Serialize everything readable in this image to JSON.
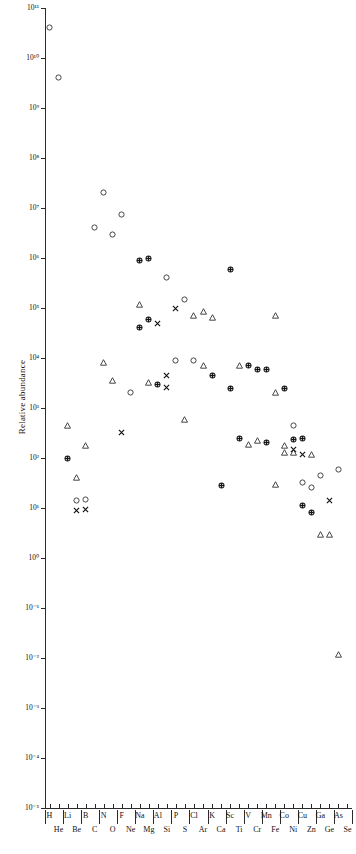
{
  "figure": {
    "ylabel": "Relative abundance",
    "plot": {
      "left": 45,
      "right": 352,
      "top": 8,
      "bottom": 808
    }
  },
  "chart_data": {
    "type": "scatter",
    "title": "",
    "xlabel": "",
    "ylabel": "Relative abundance",
    "xscale": "categorical",
    "yscale": "log",
    "ylim": [
      1e-05,
      100000000000.0
    ],
    "grid": false,
    "legend": "none",
    "ytick_labels": [
      "10¹¹",
      "10¹⁰",
      "10⁹",
      "10⁸",
      "10⁷",
      "10⁶",
      "10⁵",
      "10⁴",
      "10³",
      "10²",
      "10¹",
      "10⁰",
      "10⁻¹",
      "10⁻²",
      "10⁻³",
      "10⁻⁴",
      "10⁻⁵"
    ],
    "ytick_values": [
      100000000000.0,
      10000000000.0,
      1000000000.0,
      100000000.0,
      10000000.0,
      1000000.0,
      100000.0,
      10000.0,
      1000.0,
      100.0,
      10,
      1,
      0.1,
      0.01,
      0.001,
      0.0001,
      1e-05
    ],
    "categories": [
      "H",
      "He",
      "Li",
      "Be",
      "B",
      "C",
      "N",
      "O",
      "F",
      "Ne",
      "Na",
      "Mg",
      "Al",
      "Si",
      "P",
      "S",
      "Cl",
      "Ar",
      "K",
      "Ca",
      "Sc",
      "Ti",
      "V",
      "Cr",
      "Mn",
      "Fe",
      "Co",
      "Ni",
      "Cu",
      "Zn",
      "Ga",
      "Ge",
      "As",
      "Se"
    ],
    "categories_top_row": [
      "H",
      "Li",
      "B",
      "N",
      "F",
      "Na",
      "Al",
      "P",
      "Cl",
      "K",
      "Sc",
      "V",
      "Mn",
      "Co",
      "Cu",
      "Ga",
      "As"
    ],
    "categories_bottom_row": [
      "He",
      "Be",
      "C",
      "O",
      "Ne",
      "Mg",
      "Si",
      "S",
      "Ar",
      "Ca",
      "Ti",
      "Cr",
      "Fe",
      "Ni",
      "Zn",
      "Ge",
      "Se"
    ],
    "marker_kinds": [
      "open-circle",
      "open-triangle",
      "cross-x",
      "dotted-filled-circle"
    ],
    "points": [
      {
        "element": "H",
        "xi": 0,
        "y": 40000000000.0,
        "marker": "open-circle"
      },
      {
        "element": "He",
        "xi": 1,
        "y": 4000000000.0,
        "marker": "open-circle"
      },
      {
        "element": "Li",
        "xi": 2,
        "y": 450.0,
        "marker": "open-triangle"
      },
      {
        "element": "Li",
        "xi": 2,
        "y": 100.0,
        "marker": "dotted-filled-circle"
      },
      {
        "element": "Be",
        "xi": 3,
        "y": 40.0,
        "marker": "open-triangle"
      },
      {
        "element": "Be",
        "xi": 3,
        "y": 14.0,
        "marker": "open-circle"
      },
      {
        "element": "Be",
        "xi": 3,
        "y": 9.0,
        "marker": "cross-x"
      },
      {
        "element": "B",
        "xi": 4,
        "y": 180.0,
        "marker": "open-triangle"
      },
      {
        "element": "B",
        "xi": 4,
        "y": 15.0,
        "marker": "open-circle"
      },
      {
        "element": "B",
        "xi": 4,
        "y": 9.5,
        "marker": "cross-x"
      },
      {
        "element": "C",
        "xi": 5,
        "y": 4000000.0,
        "marker": "open-circle"
      },
      {
        "element": "N",
        "xi": 6,
        "y": 20000000.0,
        "marker": "open-circle"
      },
      {
        "element": "N",
        "xi": 6,
        "y": 8000.0,
        "marker": "open-triangle"
      },
      {
        "element": "O",
        "xi": 7,
        "y": 3000000.0,
        "marker": "open-circle"
      },
      {
        "element": "O",
        "xi": 7,
        "y": 3500.0,
        "marker": "open-triangle"
      },
      {
        "element": "F",
        "xi": 8,
        "y": 7500000.0,
        "marker": "open-circle"
      },
      {
        "element": "F",
        "xi": 8,
        "y": 320.0,
        "marker": "cross-x"
      },
      {
        "element": "Ne",
        "xi": 9,
        "y": 2000.0,
        "marker": "open-circle"
      },
      {
        "element": "Na",
        "xi": 10,
        "y": 900000.0,
        "marker": "dotted-filled-circle"
      },
      {
        "element": "Na",
        "xi": 10,
        "y": 120000.0,
        "marker": "open-triangle"
      },
      {
        "element": "Na",
        "xi": 10,
        "y": 40000.0,
        "marker": "dotted-filled-circle"
      },
      {
        "element": "Mg",
        "xi": 11,
        "y": 1000000.0,
        "marker": "dotted-filled-circle"
      },
      {
        "element": "Mg",
        "xi": 11,
        "y": 60000.0,
        "marker": "dotted-filled-circle"
      },
      {
        "element": "Mg",
        "xi": 11,
        "y": 3200.0,
        "marker": "open-triangle"
      },
      {
        "element": "Al",
        "xi": 12,
        "y": 50000.0,
        "marker": "cross-x"
      },
      {
        "element": "Al",
        "xi": 12,
        "y": 3000.0,
        "marker": "dotted-filled-circle"
      },
      {
        "element": "Si",
        "xi": 13,
        "y": 400000.0,
        "marker": "open-circle"
      },
      {
        "element": "Si",
        "xi": 13,
        "y": 4500.0,
        "marker": "cross-x"
      },
      {
        "element": "Si",
        "xi": 13,
        "y": 2600.0,
        "marker": "cross-x"
      },
      {
        "element": "P",
        "xi": 14,
        "y": 100000.0,
        "marker": "cross-x"
      },
      {
        "element": "P",
        "xi": 14,
        "y": 9000.0,
        "marker": "open-circle"
      },
      {
        "element": "S",
        "xi": 15,
        "y": 150000.0,
        "marker": "open-circle"
      },
      {
        "element": "S",
        "xi": 15,
        "y": 600.0,
        "marker": "open-triangle"
      },
      {
        "element": "Cl",
        "xi": 16,
        "y": 70000.0,
        "marker": "open-triangle"
      },
      {
        "element": "Cl",
        "xi": 16,
        "y": 9000.0,
        "marker": "open-circle"
      },
      {
        "element": "Ar",
        "xi": 17,
        "y": 85000.0,
        "marker": "open-triangle"
      },
      {
        "element": "Ar",
        "xi": 17,
        "y": 7000.0,
        "marker": "open-triangle"
      },
      {
        "element": "K",
        "xi": 18,
        "y": 65000.0,
        "marker": "open-triangle"
      },
      {
        "element": "K",
        "xi": 18,
        "y": 4500.0,
        "marker": "dotted-filled-circle"
      },
      {
        "element": "Ca",
        "xi": 19,
        "y": 28.0,
        "marker": "dotted-filled-circle"
      },
      {
        "element": "Sc",
        "xi": 20,
        "y": 600000.0,
        "marker": "dotted-filled-circle"
      },
      {
        "element": "Sc",
        "xi": 20,
        "y": 2500.0,
        "marker": "dotted-filled-circle"
      },
      {
        "element": "Ti",
        "xi": 21,
        "y": 7000.0,
        "marker": "open-triangle"
      },
      {
        "element": "Ti",
        "xi": 21,
        "y": 240.0,
        "marker": "dotted-filled-circle"
      },
      {
        "element": "V",
        "xi": 22,
        "y": 7000.0,
        "marker": "dotted-filled-circle"
      },
      {
        "element": "V",
        "xi": 22,
        "y": 190.0,
        "marker": "open-triangle"
      },
      {
        "element": "Cr",
        "xi": 23,
        "y": 6000.0,
        "marker": "dotted-filled-circle"
      },
      {
        "element": "Cr",
        "xi": 23,
        "y": 220.0,
        "marker": "open-triangle"
      },
      {
        "element": "Mn",
        "xi": 24,
        "y": 6000.0,
        "marker": "dotted-filled-circle"
      },
      {
        "element": "Mn",
        "xi": 24,
        "y": 200.0,
        "marker": "dotted-filled-circle"
      },
      {
        "element": "Fe",
        "xi": 25,
        "y": 70000.0,
        "marker": "open-triangle"
      },
      {
        "element": "Fe",
        "xi": 25,
        "y": 2000.0,
        "marker": "open-triangle"
      },
      {
        "element": "Fe",
        "xi": 25,
        "y": 30.0,
        "marker": "open-triangle"
      },
      {
        "element": "Co",
        "xi": 26,
        "y": 2500.0,
        "marker": "dotted-filled-circle"
      },
      {
        "element": "Co",
        "xi": 26,
        "y": 180.0,
        "marker": "open-triangle"
      },
      {
        "element": "Co",
        "xi": 26,
        "y": 130.0,
        "marker": "open-triangle"
      },
      {
        "element": "Ni",
        "xi": 27,
        "y": 450.0,
        "marker": "open-circle"
      },
      {
        "element": "Ni",
        "xi": 27,
        "y": 230.0,
        "marker": "dotted-filled-circle"
      },
      {
        "element": "Ni",
        "xi": 27,
        "y": 150.0,
        "marker": "cross-x"
      },
      {
        "element": "Ni",
        "xi": 27,
        "y": 130.0,
        "marker": "open-triangle"
      },
      {
        "element": "Cu",
        "xi": 28,
        "y": 240.0,
        "marker": "dotted-filled-circle"
      },
      {
        "element": "Cu",
        "xi": 28,
        "y": 120.0,
        "marker": "cross-x"
      },
      {
        "element": "Cu",
        "xi": 28,
        "y": 32.0,
        "marker": "open-circle"
      },
      {
        "element": "Cu",
        "xi": 28,
        "y": 11.0,
        "marker": "dotted-filled-circle"
      },
      {
        "element": "Zn",
        "xi": 29,
        "y": 120.0,
        "marker": "open-triangle"
      },
      {
        "element": "Zn",
        "xi": 29,
        "y": 26.0,
        "marker": "open-circle"
      },
      {
        "element": "Zn",
        "xi": 29,
        "y": 8.0,
        "marker": "dotted-filled-circle"
      },
      {
        "element": "Ga",
        "xi": 30,
        "y": 45.0,
        "marker": "open-circle"
      },
      {
        "element": "Ga",
        "xi": 30,
        "y": 3.0,
        "marker": "open-triangle"
      },
      {
        "element": "Ge",
        "xi": 31,
        "y": 14.0,
        "marker": "cross-x"
      },
      {
        "element": "Ge",
        "xi": 31,
        "y": 3.0,
        "marker": "open-triangle"
      },
      {
        "element": "As",
        "xi": 32,
        "y": 60.0,
        "marker": "open-circle"
      },
      {
        "element": "As",
        "xi": 32,
        "y": 0.012,
        "marker": "open-triangle"
      }
    ]
  }
}
